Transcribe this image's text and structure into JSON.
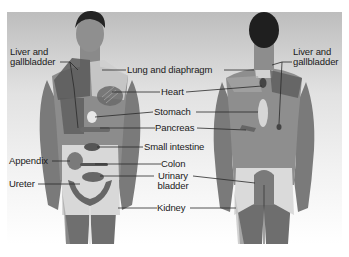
{
  "diagram": {
    "type": "anatomical referred pain map",
    "views": [
      {
        "id": "front",
        "label": "anterior view"
      },
      {
        "id": "back",
        "label": "posterior view"
      }
    ],
    "labels": {
      "liver_gallbladder_front": "Liver and gallbladder",
      "liver_gallbladder_front_l1": "Liver and",
      "liver_gallbladder_front_l2": "gallbladder",
      "liver_gallbladder_back_l1": "Liver and",
      "liver_gallbladder_back_l2": "gallbladder",
      "lung_diaphragm": "Lung and diaphragm",
      "heart": "Heart",
      "stomach": "Stomach",
      "pancreas": "Pancreas",
      "small_intestine": "Small intestine",
      "appendix": "Appendix",
      "colon": "Colon",
      "ureter": "Ureter",
      "urinary_bladder_l1": "Urinary",
      "urinary_bladder_l2": "bladder",
      "kidney": "Kidney"
    },
    "colors": {
      "background": "#ffffff",
      "skin_dark": "#6e6e6e",
      "skin_mid": "#8f8f8f",
      "region_light": "#d6d6d6",
      "region_dark": "#555555",
      "hair": "#1e1e1e",
      "leader_line": "#2a2a2a"
    }
  }
}
